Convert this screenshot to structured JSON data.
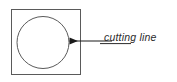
{
  "diagram": {
    "background_color": "#ffffff",
    "stroke_color": "#5a5a5a",
    "arrow_color": "#1a1a1a",
    "text_color": "#2b2b2b",
    "shapes": {
      "square": {
        "name": "workpiece-square",
        "x": 11,
        "y": 9,
        "width": 70,
        "height": 66,
        "stroke_width": 1
      },
      "circle": {
        "name": "cut-circle",
        "cx": 43,
        "cy": 42.5,
        "r": 26,
        "stroke_width": 1
      }
    },
    "annotation": {
      "leader_line": {
        "name": "leader-line",
        "x1": 112,
        "y1": 41,
        "x2": 68,
        "y2": 41,
        "stroke_width": 1.2,
        "arrow_head": "left"
      },
      "label": "cutting line",
      "label_x": 104,
      "label_y": 41,
      "underline": {
        "x1": 100,
        "y1": 43.5,
        "x2": 131,
        "y2": 43.5
      }
    }
  }
}
